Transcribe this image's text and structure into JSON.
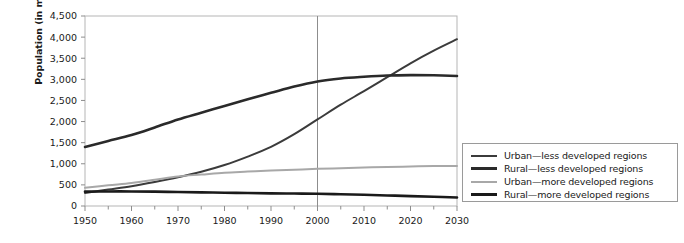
{
  "chart_data": {
    "type": "line",
    "title": "",
    "xlabel": "",
    "ylabel": "Population (in millions)",
    "xlim": [
      1950,
      2030
    ],
    "ylim": [
      0,
      4500
    ],
    "ytick_step": 500,
    "xtick_step": 10,
    "xminor_step": 5,
    "grid": false,
    "legend_position": "right",
    "yticks": [
      "0",
      "500",
      "1,000",
      "1,500",
      "2,000",
      "2,500",
      "3,000",
      "3,500",
      "4,000",
      "4,500"
    ],
    "xticks": [
      "1950",
      "1960",
      "1970",
      "1980",
      "1990",
      "2000",
      "2010",
      "2020",
      "2030"
    ],
    "annotations": [
      {
        "name": "year-2000-reference-line",
        "type": "vline",
        "x": 2000
      }
    ],
    "x": [
      1950,
      1955,
      1960,
      1965,
      1970,
      1975,
      1980,
      1985,
      1990,
      1995,
      2000,
      2005,
      2010,
      2015,
      2020,
      2025,
      2030
    ],
    "series": [
      {
        "name": "Urban—less developed regions",
        "color": "#3b3b3b",
        "width": 2.0,
        "values": [
          310,
          390,
          470,
          570,
          680,
          810,
          970,
          1170,
          1400,
          1700,
          2050,
          2400,
          2720,
          3050,
          3380,
          3680,
          3950
        ]
      },
      {
        "name": "Rural—less developed regions",
        "color": "#2a2a2a",
        "width": 2.6,
        "values": [
          1400,
          1540,
          1680,
          1860,
          2050,
          2210,
          2370,
          2530,
          2680,
          2830,
          2950,
          3020,
          3060,
          3090,
          3100,
          3095,
          3080
        ]
      },
      {
        "name": "Urban—more developed regions",
        "color": "#a8a8a8",
        "width": 2.0,
        "values": [
          430,
          490,
          545,
          620,
          700,
          745,
          790,
          815,
          840,
          860,
          880,
          895,
          910,
          925,
          935,
          945,
          950
        ]
      },
      {
        "name": "Rural—more developed regions",
        "color": "#1a1a1a",
        "width": 2.6,
        "values": [
          340,
          345,
          345,
          340,
          330,
          322,
          315,
          307,
          300,
          295,
          290,
          278,
          265,
          250,
          235,
          218,
          200
        ]
      }
    ]
  },
  "legend": {
    "items": [
      {
        "label": "Urban—less developed regions",
        "color": "#3b3b3b",
        "width": 2
      },
      {
        "label": "Rural—less developed regions",
        "color": "#2a2a2a",
        "width": 3
      },
      {
        "label": "Urban—more developed regions",
        "color": "#a8a8a8",
        "width": 2
      },
      {
        "label": "Rural—more developed regions",
        "color": "#1a1a1a",
        "width": 3
      }
    ]
  }
}
